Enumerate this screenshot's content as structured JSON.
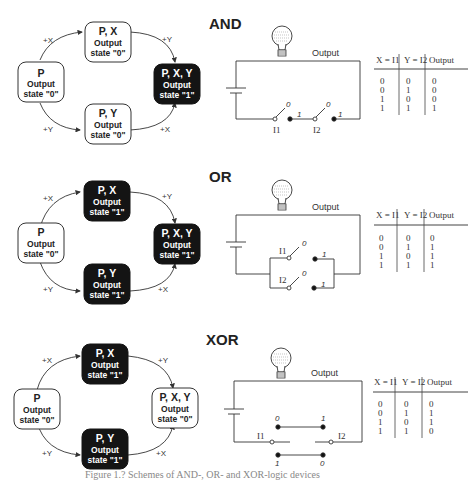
{
  "panels": [
    {
      "title": "AND",
      "state_graph": {
        "nodes": [
          {
            "id": "p",
            "label": "P",
            "sub1": "Output",
            "sub2": "state \"0\"",
            "filled": false
          },
          {
            "id": "px",
            "label": "P, X",
            "sub1": "Output",
            "sub2": "state \"0\"",
            "filled": false
          },
          {
            "id": "py",
            "label": "P, Y",
            "sub1": "Output",
            "sub2": "state \"0\"",
            "filled": false
          },
          {
            "id": "pxy",
            "label": "P, X, Y",
            "sub1": "Output",
            "sub2": "state \"1\"",
            "filled": true
          }
        ],
        "edges": [
          {
            "from": "p",
            "to": "px",
            "label": "+X"
          },
          {
            "from": "px",
            "to": "pxy",
            "label": "+Y"
          },
          {
            "from": "p",
            "to": "py",
            "label": "+Y"
          },
          {
            "from": "py",
            "to": "pxy",
            "label": "+X"
          }
        ]
      },
      "circuit": {
        "output_label": "Output",
        "switch1": "I1",
        "switch2": "I2",
        "switch1_states": [
          "0",
          "1"
        ],
        "switch2_states": [
          "0",
          "1"
        ]
      },
      "truth_table": {
        "headers": [
          "X = I1",
          "Y = I2",
          "Output"
        ],
        "rows": [
          [
            "0",
            "0",
            "0"
          ],
          [
            "0",
            "1",
            "0"
          ],
          [
            "1",
            "0",
            "0"
          ],
          [
            "1",
            "1",
            "1"
          ]
        ]
      }
    },
    {
      "title": "OR",
      "state_graph": {
        "nodes": [
          {
            "id": "p",
            "label": "P",
            "sub1": "Output",
            "sub2": "state \"0\"",
            "filled": false
          },
          {
            "id": "px",
            "label": "P, X",
            "sub1": "Output",
            "sub2": "state \"1\"",
            "filled": true
          },
          {
            "id": "py",
            "label": "P, Y",
            "sub1": "Output",
            "sub2": "state \"1\"",
            "filled": true
          },
          {
            "id": "pxy",
            "label": "P, X, Y",
            "sub1": "Output",
            "sub2": "state \"1\"",
            "filled": true
          }
        ],
        "edges": [
          {
            "from": "p",
            "to": "px",
            "label": "+X"
          },
          {
            "from": "px",
            "to": "pxy",
            "label": "+Y"
          },
          {
            "from": "p",
            "to": "py",
            "label": "+Y"
          },
          {
            "from": "py",
            "to": "pxy",
            "label": "+X"
          }
        ]
      },
      "circuit": {
        "output_label": "Output",
        "switch1": "I1",
        "switch2": "I2",
        "switch1_states": [
          "0",
          "1"
        ],
        "switch2_states": [
          "0",
          "1"
        ]
      },
      "truth_table": {
        "headers": [
          "X = I1",
          "Y = I2",
          "Output"
        ],
        "rows": [
          [
            "0",
            "0",
            "0"
          ],
          [
            "0",
            "1",
            "1"
          ],
          [
            "1",
            "0",
            "1"
          ],
          [
            "1",
            "1",
            "1"
          ]
        ]
      }
    },
    {
      "title": "XOR",
      "state_graph": {
        "nodes": [
          {
            "id": "p",
            "label": "P",
            "sub1": "Output",
            "sub2": "state \"0\"",
            "filled": false
          },
          {
            "id": "px",
            "label": "P, X",
            "sub1": "Output",
            "sub2": "state \"1\"",
            "filled": true
          },
          {
            "id": "py",
            "label": "P, Y",
            "sub1": "Output",
            "sub2": "state \"1\"",
            "filled": true
          },
          {
            "id": "pxy",
            "label": "P, X, Y",
            "sub1": "Output",
            "sub2": "state \"0\"",
            "filled": false
          }
        ],
        "edges": [
          {
            "from": "p",
            "to": "px",
            "label": "+X"
          },
          {
            "from": "px",
            "to": "pxy",
            "label": "+Y"
          },
          {
            "from": "p",
            "to": "py",
            "label": "+Y"
          },
          {
            "from": "py",
            "to": "pxy",
            "label": "+X"
          }
        ]
      },
      "circuit": {
        "output_label": "Output",
        "switch1": "I1",
        "switch2": "I2",
        "top_contacts": [
          "0",
          "1"
        ],
        "bottom_contacts": [
          "1",
          "0"
        ]
      },
      "truth_table": {
        "headers": [
          "X = I1",
          "Y = I2",
          "Output"
        ],
        "rows": [
          [
            "0",
            "0",
            "0"
          ],
          [
            "0",
            "1",
            "1"
          ],
          [
            "1",
            "0",
            "1"
          ],
          [
            "1",
            "1",
            "0"
          ]
        ]
      }
    }
  ],
  "caption": "Figure 1.? Schemes of AND-, OR- and XOR-logic devices"
}
